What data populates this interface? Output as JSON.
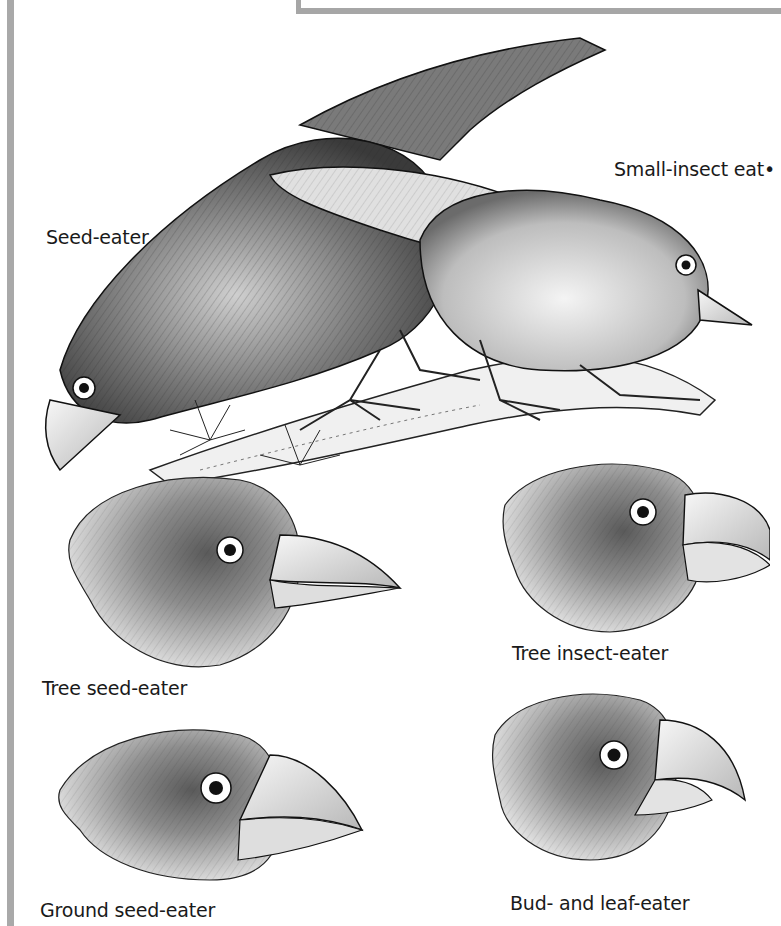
{
  "figure": {
    "labels": {
      "seed_eater": "Seed-eater",
      "small_insect_eater": "Small-insect eat•",
      "tree_seed_eater": "Tree seed-eater",
      "tree_insect_eater": "Tree insect-eater",
      "ground_seed_eater": "Ground seed-eater",
      "bud_leaf_eater": "Bud- and leaf-eater"
    },
    "colors": {
      "frame_gray": "#a9a9a9",
      "ink": "#1a1a1a",
      "background": "#ffffff"
    }
  }
}
